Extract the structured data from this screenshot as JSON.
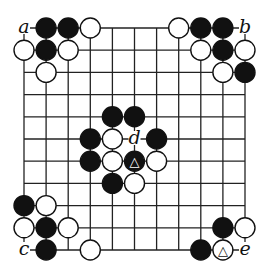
{
  "diagram": {
    "type": "go-board-diagram",
    "size": 11,
    "origin": {
      "x": 24,
      "y": 28
    },
    "spacing": {
      "x": 22.1,
      "y": 22.2
    },
    "stone_radius": 10,
    "colors": {
      "black": "#111111",
      "white": "#ffffff",
      "line": "#222222",
      "background": "#ffffff"
    },
    "stones": [
      {
        "col": 1,
        "row": 0,
        "color": "black"
      },
      {
        "col": 2,
        "row": 0,
        "color": "black"
      },
      {
        "col": 3,
        "row": 0,
        "color": "white"
      },
      {
        "col": 0,
        "row": 1,
        "color": "white"
      },
      {
        "col": 1,
        "row": 1,
        "color": "black"
      },
      {
        "col": 2,
        "row": 1,
        "color": "white"
      },
      {
        "col": 1,
        "row": 2,
        "color": "white"
      },
      {
        "col": 7,
        "row": 0,
        "color": "white"
      },
      {
        "col": 8,
        "row": 0,
        "color": "black"
      },
      {
        "col": 9,
        "row": 0,
        "color": "black"
      },
      {
        "col": 8,
        "row": 1,
        "color": "white"
      },
      {
        "col": 9,
        "row": 1,
        "color": "black"
      },
      {
        "col": 10,
        "row": 1,
        "color": "white"
      },
      {
        "col": 9,
        "row": 2,
        "color": "white"
      },
      {
        "col": 10,
        "row": 2,
        "color": "black"
      },
      {
        "col": 4,
        "row": 4,
        "color": "black"
      },
      {
        "col": 5,
        "row": 4,
        "color": "black"
      },
      {
        "col": 3,
        "row": 5,
        "color": "black"
      },
      {
        "col": 4,
        "row": 5,
        "color": "white"
      },
      {
        "col": 6,
        "row": 5,
        "color": "black"
      },
      {
        "col": 3,
        "row": 6,
        "color": "black"
      },
      {
        "col": 4,
        "row": 6,
        "color": "white"
      },
      {
        "col": 5,
        "row": 6,
        "color": "black",
        "mark": "triangle"
      },
      {
        "col": 6,
        "row": 6,
        "color": "white"
      },
      {
        "col": 4,
        "row": 7,
        "color": "black"
      },
      {
        "col": 5,
        "row": 7,
        "color": "white"
      },
      {
        "col": 0,
        "row": 8,
        "color": "black"
      },
      {
        "col": 1,
        "row": 8,
        "color": "white"
      },
      {
        "col": 0,
        "row": 9,
        "color": "white"
      },
      {
        "col": 1,
        "row": 9,
        "color": "black"
      },
      {
        "col": 2,
        "row": 9,
        "color": "white"
      },
      {
        "col": 1,
        "row": 10,
        "color": "black"
      },
      {
        "col": 3,
        "row": 10,
        "color": "white"
      },
      {
        "col": 9,
        "row": 9,
        "color": "black"
      },
      {
        "col": 10,
        "row": 9,
        "color": "white"
      },
      {
        "col": 8,
        "row": 10,
        "color": "black"
      },
      {
        "col": 9,
        "row": 10,
        "color": "white",
        "mark": "triangle"
      }
    ],
    "labels": [
      {
        "col": 0,
        "row": 0,
        "text": "a"
      },
      {
        "col": 10,
        "row": 0,
        "text": "b"
      },
      {
        "col": 0,
        "row": 10,
        "text": "c"
      },
      {
        "col": 5,
        "row": 5,
        "text": "d"
      },
      {
        "col": 10,
        "row": 10,
        "text": "e"
      }
    ],
    "mark_symbol": "△"
  }
}
